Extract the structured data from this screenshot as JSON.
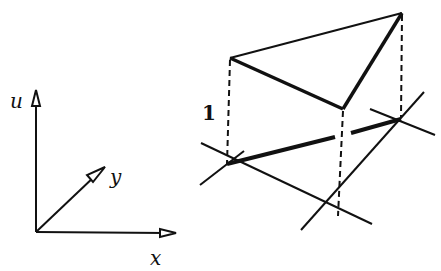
{
  "axes": {
    "u_label": "u",
    "y_label": "y",
    "x_label": "x"
  },
  "figure": {
    "height_label": "1"
  }
}
